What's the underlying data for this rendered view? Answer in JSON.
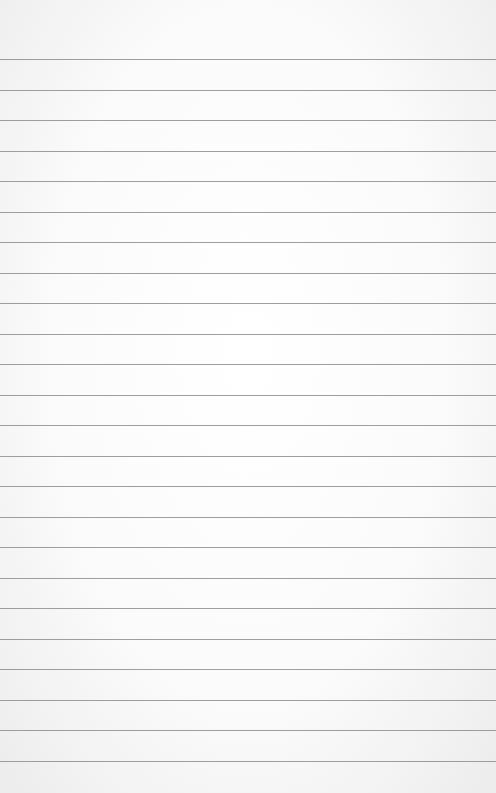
{
  "paper": {
    "type": "lined-paper",
    "line_color": "#8d8d8d",
    "background_color": "#fbfbfb",
    "first_line_y": 59,
    "line_spacing": 30.5,
    "line_count": 24
  }
}
